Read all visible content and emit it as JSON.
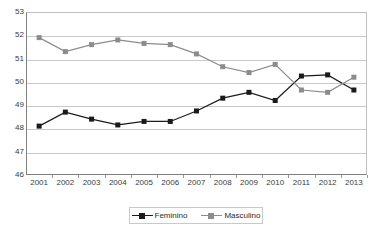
{
  "chart_data": {
    "type": "line",
    "title": "",
    "subtitle": "",
    "xlabel": "",
    "ylabel": "",
    "categories": [
      "2001",
      "2002",
      "2003",
      "2004",
      "2005",
      "2006",
      "2007",
      "2008",
      "2009",
      "2010",
      "2011",
      "2012",
      "2013"
    ],
    "x": [
      2001,
      2002,
      2003,
      2004,
      2005,
      2006,
      2007,
      2008,
      2009,
      2010,
      2011,
      2012,
      2013
    ],
    "series": [
      {
        "name": "Feminino",
        "color": "#1a1a1a",
        "marker": "square",
        "values": [
          48.1,
          48.7,
          48.4,
          48.15,
          48.3,
          48.3,
          48.75,
          49.3,
          49.55,
          49.2,
          50.25,
          50.3,
          49.65
        ]
      },
      {
        "name": "Masculino",
        "color": "#8c8c8c",
        "marker": "square",
        "values": [
          51.9,
          51.3,
          51.6,
          51.8,
          51.65,
          51.6,
          51.2,
          50.65,
          50.4,
          50.75,
          49.65,
          49.55,
          50.2
        ]
      }
    ],
    "ylim": [
      46,
      53
    ],
    "yticks": [
      46,
      47,
      48,
      49,
      50,
      51,
      52,
      53
    ],
    "ytick_labels": [
      "46",
      "47",
      "48",
      "49",
      "50",
      "51",
      "52",
      "53"
    ],
    "grid": true,
    "grid_axis": "y",
    "legend": {
      "position": "bottom",
      "entries": [
        {
          "label": "Feminino",
          "color": "#1a1a1a"
        },
        {
          "label": "Masculino",
          "color": "#8c8c8c"
        }
      ]
    },
    "colors": {
      "feminino": "#1a1a1a",
      "masculino": "#8c8c8c",
      "grid": "#c9c9c9",
      "axis": "#808080",
      "background": "#ffffff",
      "text": "#3b3b3b"
    }
  }
}
